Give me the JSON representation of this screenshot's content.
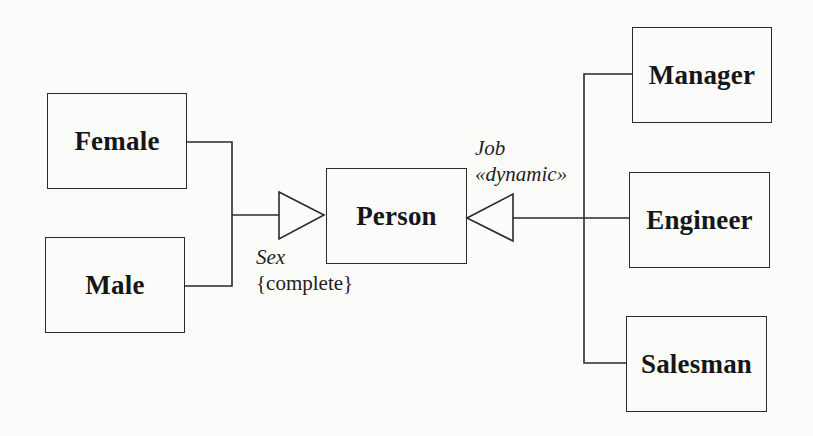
{
  "diagram": {
    "type": "UML class diagram — generalization sets",
    "classes": {
      "female": {
        "name": "Female"
      },
      "male": {
        "name": "Male"
      },
      "person": {
        "name": "Person"
      },
      "manager": {
        "name": "Manager"
      },
      "engineer": {
        "name": "Engineer"
      },
      "salesman": {
        "name": "Salesman"
      }
    },
    "generalizations": {
      "sex": {
        "name": "Sex",
        "constraint": "{complete}",
        "subclasses": [
          "Female",
          "Male"
        ],
        "superclass": "Person"
      },
      "job": {
        "name": "Job",
        "stereotype": "«dynamic»",
        "subclasses": [
          "Manager",
          "Engineer",
          "Salesman"
        ],
        "superclass": "Person"
      }
    },
    "colors": {
      "line": "#2a2a2a",
      "background": "#fbfbfa",
      "text": "#161616"
    }
  }
}
